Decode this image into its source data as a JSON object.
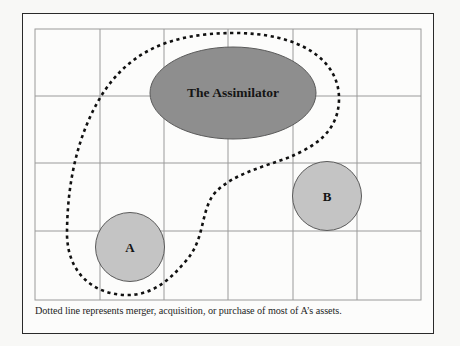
{
  "diagram": {
    "nodes": {
      "assimilator": {
        "label": "The Assimilator",
        "fill": "#8e8e8e"
      },
      "a": {
        "label": "A",
        "fill": "#c4c4c4"
      },
      "b": {
        "label": "B",
        "fill": "#c4c4c4"
      }
    },
    "grid": {
      "columns": 6,
      "rows": 4,
      "line_color": "#9a9a9a"
    },
    "boundary": {
      "style": "dotted",
      "color": "#111111"
    },
    "caption": "Dotted line represents merger, acquisition, or purchase of most of A’s assets."
  }
}
